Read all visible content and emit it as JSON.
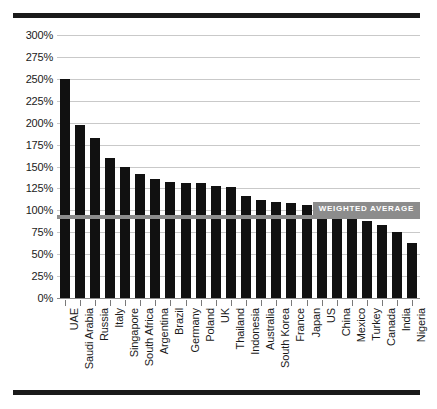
{
  "chart_data": {
    "type": "bar",
    "title": "",
    "subtitle": "",
    "xlabel": "",
    "ylabel": "",
    "ylim": [
      0,
      300
    ],
    "ytick_step": 25,
    "ytick_labels": [
      "300%",
      "275%",
      "250%",
      "225%",
      "200%",
      "175%",
      "150%",
      "125%",
      "100%",
      "75%",
      "50%",
      "25%",
      "0%"
    ],
    "ytick_values": [
      300,
      275,
      250,
      225,
      200,
      175,
      150,
      125,
      100,
      75,
      50,
      25,
      0
    ],
    "grid": true,
    "legend_position": "none",
    "categories": [
      "UAE",
      "Saudi Arabia",
      "Russia",
      "Italy",
      "Singapore",
      "South Africa",
      "Argentina",
      "Brazil",
      "Germany",
      "Poland",
      "UK",
      "Thailand",
      "Indonesia",
      "Australia",
      "South Korea",
      "France",
      "Japan",
      "US",
      "China",
      "Mexico",
      "Turkey",
      "Canada",
      "India",
      "Nigeria"
    ],
    "values": [
      250,
      197,
      183,
      160,
      149,
      141,
      136,
      132,
      131,
      131,
      128,
      127,
      116,
      112,
      110,
      108,
      106,
      105,
      92,
      90,
      88,
      83,
      75,
      63
    ],
    "annotations": [
      {
        "name": "weighted-average",
        "label": "WEIGHTED AVERAGE",
        "value": 92,
        "orientation": "horizontal"
      }
    ],
    "colors": {
      "bar": "#111111",
      "grid": "#c9c9c9",
      "baseline": "#8a8a8a",
      "annotation": "#8c8c8c",
      "annotation_text": "#ffffff",
      "rule": "#1a1a1a",
      "text": "#1a1a1a",
      "background": "#ffffff"
    }
  }
}
